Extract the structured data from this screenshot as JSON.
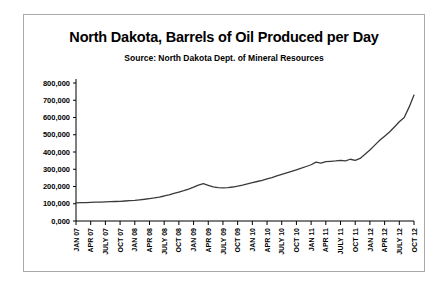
{
  "figure": {
    "title": "North Dakota, Barrels of Oil Produced per Day",
    "subtitle": "Source: North Dakota Dept. of Mineral Resources"
  },
  "chart_data": {
    "type": "line",
    "title": "North Dakota, Barrels of Oil Produced per Day",
    "subtitle": "Source: North Dakota Dept. of Mineral Resources",
    "xlabel": "",
    "ylabel": "",
    "ylim": [
      0,
      800000
    ],
    "ytick_labels": [
      "0,000",
      "100,000",
      "200,000",
      "300,000",
      "400,000",
      "500,000",
      "600,000",
      "700,000",
      "800,000"
    ],
    "ytick_values": [
      0,
      100000,
      200000,
      300000,
      400000,
      500000,
      600000,
      700000,
      800000
    ],
    "grid": false,
    "legend": false,
    "line_color": "#3a3a3a",
    "xtick_labels": [
      "JAN 07",
      "APR 07",
      "JULY 07",
      "OCT 07",
      "JAN 08",
      "APR 08",
      "JULY 08",
      "OCT 08",
      "JAN 09",
      "APR 09",
      "JULY 09",
      "OCT 09",
      "JAN 10",
      "APR 10",
      "JULY 10",
      "OCT 10",
      "JAN 11",
      "APR 11",
      "JULY 11",
      "OCT 11",
      "JAN 12",
      "APR 12",
      "JULY 12",
      "OCT 12"
    ],
    "x": [
      "JAN 07",
      "FEB 07",
      "MAR 07",
      "APR 07",
      "MAY 07",
      "JUN 07",
      "JUL 07",
      "AUG 07",
      "SEP 07",
      "OCT 07",
      "NOV 07",
      "DEC 07",
      "JAN 08",
      "FEB 08",
      "MAR 08",
      "APR 08",
      "MAY 08",
      "JUN 08",
      "JUL 08",
      "AUG 08",
      "SEP 08",
      "OCT 08",
      "NOV 08",
      "DEC 08",
      "JAN 09",
      "FEB 09",
      "MAR 09",
      "APR 09",
      "MAY 09",
      "JUN 09",
      "JUL 09",
      "AUG 09",
      "SEP 09",
      "OCT 09",
      "NOV 09",
      "DEC 09",
      "JAN 10",
      "FEB 10",
      "MAR 10",
      "APR 10",
      "MAY 10",
      "JUN 10",
      "JUL 10",
      "AUG 10",
      "SEP 10",
      "OCT 10",
      "NOV 10",
      "DEC 10",
      "JAN 11",
      "FEB 11",
      "MAR 11",
      "APR 11",
      "MAY 11",
      "JUN 11",
      "JUL 11",
      "AUG 11",
      "SEP 11",
      "OCT 11",
      "NOV 11",
      "DEC 11",
      "JAN 12",
      "FEB 12",
      "MAR 12",
      "APR 12",
      "MAY 12",
      "JUN 12",
      "JUL 12",
      "AUG 12",
      "SEP 12",
      "OCT 12"
    ],
    "values": [
      105000,
      106000,
      107000,
      108000,
      109000,
      110000,
      111000,
      112000,
      113000,
      114000,
      116000,
      118000,
      120000,
      123000,
      126000,
      130000,
      134000,
      139000,
      145000,
      152000,
      160000,
      168000,
      176000,
      185000,
      196000,
      208000,
      216000,
      207000,
      198000,
      193000,
      192000,
      194000,
      197000,
      202000,
      208000,
      215000,
      222000,
      229000,
      236000,
      244000,
      252000,
      261000,
      270000,
      279000,
      288000,
      297000,
      306000,
      316000,
      326000,
      341000,
      336000,
      344000,
      346000,
      348000,
      352000,
      349000,
      358000,
      352000,
      363000,
      387000,
      412000,
      440000,
      468000,
      492000,
      516000,
      545000,
      575000,
      600000,
      660000,
      730000
    ]
  }
}
